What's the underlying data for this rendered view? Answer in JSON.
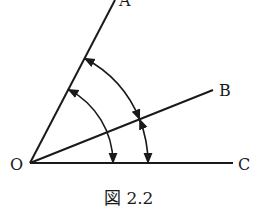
{
  "figure": {
    "caption": "図 2.2",
    "points": {
      "O": {
        "label": "O",
        "x": 30,
        "y": 163
      },
      "A": {
        "label": "A",
        "x": 115,
        "y": 0
      },
      "B": {
        "label": "B",
        "x": 213,
        "y": 90
      },
      "C": {
        "label": "C",
        "x": 233,
        "y": 163
      }
    },
    "rays": [
      "OA",
      "OB",
      "OC"
    ],
    "arcs": [
      {
        "name": "angle-AOC",
        "from": "OA",
        "to": "OC",
        "radius": 83,
        "arrows": "both"
      },
      {
        "name": "angle-AOB",
        "from": "OA",
        "to": "OB",
        "radius": 118,
        "arrows": "both"
      },
      {
        "name": "angle-BOC",
        "from": "OB",
        "to": "OC",
        "radius": 118,
        "arrows": "both"
      }
    ],
    "colors": {
      "stroke": "#1a1a1a",
      "background": "#ffffff"
    }
  }
}
